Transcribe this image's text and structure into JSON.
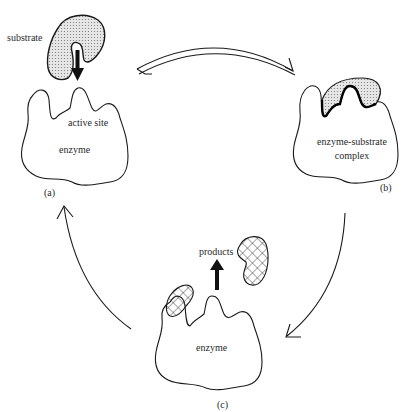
{
  "diagram": {
    "panels": [
      {
        "id": "a",
        "caption": "(a)",
        "labels": {
          "substrate": "substrate",
          "active_site": "active site",
          "enzyme": "enzyme"
        }
      },
      {
        "id": "b",
        "caption": "(b)",
        "labels": {
          "complex_line1": "enzyme-substrate",
          "complex_line2": "complex"
        }
      },
      {
        "id": "c",
        "caption": "(c)",
        "labels": {
          "products": "products",
          "enzyme": "enzyme"
        }
      }
    ],
    "arrows": [
      {
        "from": "a",
        "to": "b",
        "type": "reversible"
      },
      {
        "from": "b",
        "to": "c",
        "type": "forward"
      },
      {
        "from": "c",
        "to": "a",
        "type": "forward"
      }
    ],
    "colors": {
      "line": "#1a1a1a",
      "substrate_fill": "#d9d9d9",
      "background": "#ffffff"
    }
  }
}
